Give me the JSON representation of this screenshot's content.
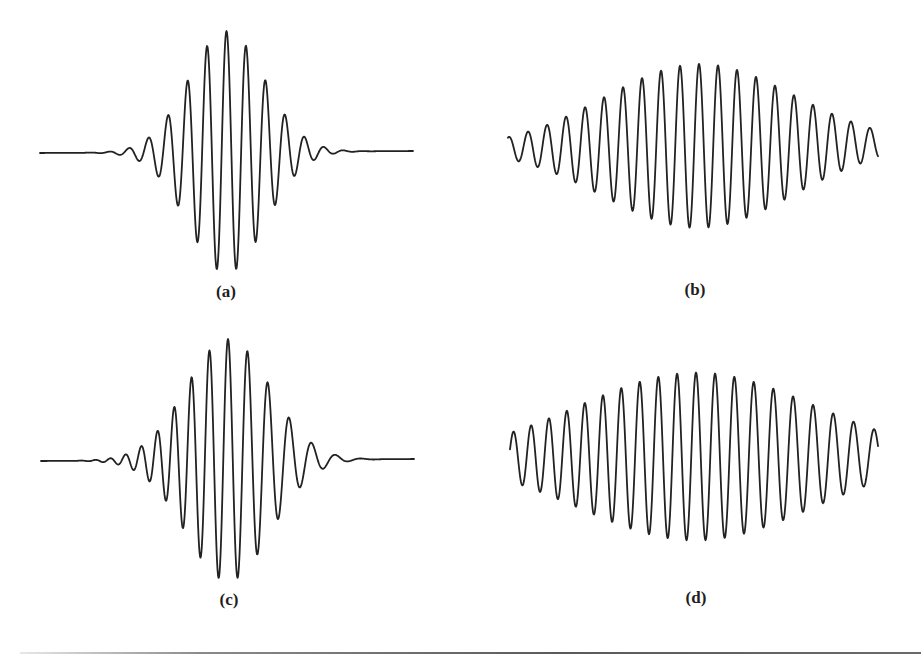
{
  "figure": {
    "background": "#ffffff",
    "stroke_color": "#222222",
    "stroke_width": 1.8,
    "panels": [
      {
        "id": "a",
        "label": "(a)",
        "label_pos": [
          226,
          282
        ],
        "x_start": 40,
        "x_end": 413,
        "baseline_y_start": 153,
        "baseline_y_end": 151,
        "center_x": 226.5,
        "period": 19.5,
        "amplitude": 121,
        "sigma": 38,
        "chirp": 0,
        "phase": 0
      },
      {
        "id": "b",
        "label": "(b)",
        "label_pos": [
          695,
          280
        ],
        "x_start": 508,
        "x_end": 878,
        "baseline_y_start": 148,
        "baseline_y_end": 144,
        "center_x": 699,
        "period": 19,
        "amplitude": 82,
        "sigma": 95,
        "chirp": 0,
        "phase": 0
      },
      {
        "id": "c",
        "label": "(c)",
        "label_pos": [
          229,
          590
        ],
        "x_start": 41,
        "x_end": 414,
        "baseline_y_start": 461,
        "baseline_y_end": 459,
        "center_x": 228,
        "period": 19,
        "amplitude": 121,
        "sigma": 42,
        "chirp": 0.022,
        "phase": 0
      },
      {
        "id": "d",
        "label": "(d)",
        "label_pos": [
          696,
          588
        ],
        "x_start": 510,
        "x_end": 878,
        "baseline_y_start": 457,
        "baseline_y_end": 456,
        "center_x": 696,
        "period": 19,
        "amplitude": 84,
        "sigma": 118,
        "chirp": 0.0045,
        "phase": 0
      }
    ]
  },
  "chart_data": [
    {
      "type": "line",
      "title": "(a)",
      "description": "Symmetric Gaussian-modulated sinusoidal wave packet, narrow envelope",
      "xlabel": "",
      "ylabel": "",
      "grid": false,
      "legend": null,
      "peak_x_px": [
        149,
        168,
        187,
        207,
        226,
        246,
        265,
        284,
        304
      ],
      "peak_y_px": [
        150,
        130,
        95,
        50,
        28,
        50,
        95,
        130,
        150
      ],
      "baseline_y_px": 152,
      "relative_peak_amplitudes": [
        0.02,
        0.18,
        0.47,
        0.84,
        1.0,
        0.84,
        0.47,
        0.18,
        0.02
      ]
    },
    {
      "type": "line",
      "title": "(b)",
      "description": "Symmetric Gaussian-modulated sinusoidal wave packet, broad envelope",
      "xlabel": "",
      "ylabel": "",
      "grid": false,
      "legend": null,
      "peak_x_px": [
        523,
        539,
        555,
        573,
        590,
        607,
        624,
        643,
        661,
        679,
        699,
        718,
        737,
        758,
        780,
        802,
        824,
        847
      ],
      "peak_y_px": [
        143,
        141,
        137,
        130,
        121,
        110,
        98,
        84,
        74,
        66,
        64,
        68,
        78,
        93,
        108,
        122,
        133,
        139
      ],
      "baseline_y_px": 147,
      "relative_peak_amplitudes": [
        0.05,
        0.07,
        0.12,
        0.2,
        0.31,
        0.45,
        0.59,
        0.76,
        0.88,
        0.98,
        1.0,
        0.95,
        0.83,
        0.65,
        0.47,
        0.3,
        0.17,
        0.1
      ]
    },
    {
      "type": "line",
      "title": "(c)",
      "description": "Chirped wave packet, narrow envelope: frequency decreases left to right (high frequency on left, single slow oscillation on right)",
      "xlabel": "",
      "ylabel": "",
      "grid": false,
      "legend": null,
      "peak_x_px": [
        133,
        145,
        156,
        168,
        181,
        195,
        210,
        228,
        250,
        279
      ],
      "peak_y_px": [
        457,
        455,
        451,
        441,
        422,
        390,
        355,
        335,
        361,
        427
      ],
      "baseline_y_px": 459,
      "relative_peak_amplitudes": [
        0.02,
        0.03,
        0.06,
        0.15,
        0.3,
        0.56,
        0.84,
        1.0,
        0.79,
        0.26
      ]
    },
    {
      "type": "line",
      "title": "(d)",
      "description": "Chirped wave packet, broad envelope: frequency decreases left to right",
      "xlabel": "",
      "ylabel": "",
      "grid": false,
      "legend": null,
      "peak_x_px": [
        515,
        527,
        538,
        550,
        562,
        575,
        588,
        601,
        615,
        629,
        644,
        661,
        678,
        696,
        716,
        738,
        764,
        795,
        837
      ],
      "peak_y_px": [
        450,
        449,
        447,
        445,
        442,
        437,
        430,
        422,
        413,
        402,
        391,
        381,
        373,
        371,
        375,
        385,
        403,
        425,
        443
      ],
      "baseline_y_px": 456,
      "relative_peak_amplitudes": [
        0.07,
        0.08,
        0.11,
        0.13,
        0.16,
        0.22,
        0.31,
        0.4,
        0.51,
        0.64,
        0.76,
        0.88,
        0.98,
        1.0,
        0.95,
        0.83,
        0.63,
        0.37,
        0.15
      ]
    }
  ]
}
